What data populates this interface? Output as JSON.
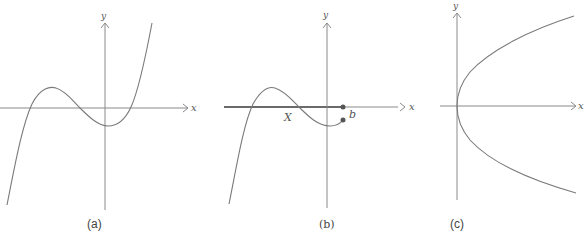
{
  "figure": {
    "panels": [
      {
        "id": "a",
        "caption": "(a)",
        "axis_labels": {
          "x": "x",
          "y": "y"
        },
        "description": "Graph of a cubic-like function with a local max left of the y-axis and a local min just right of it"
      },
      {
        "id": "b",
        "caption": "(b)",
        "axis_labels": {
          "x": "x",
          "y": "y"
        },
        "annotations": {
          "set_label": "X",
          "point_label": "b"
        },
        "description": "Same cubic restricted to the interval X ending at b, with the interval highlighted on the x-axis and endpoint dots at b"
      },
      {
        "id": "c",
        "caption": "(c)",
        "axis_labels": {
          "x": "x",
          "y": "y"
        },
        "description": "Sideways parabola x = y^2 opening to the right with vertex at the origin"
      }
    ],
    "colors": {
      "axis": "#8a8a8a",
      "curve": "#7a7a7a",
      "highlight": "#6a6a6a",
      "text": "#555555"
    }
  }
}
